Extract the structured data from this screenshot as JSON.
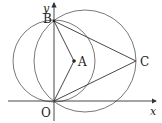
{
  "diagram": {
    "type": "geometry-coordinate-plane",
    "axes": {
      "x_label": "x",
      "y_label": "y"
    },
    "points": {
      "O": {
        "label": "O",
        "x": 54,
        "y": 101
      },
      "B": {
        "label": "B",
        "x": 54,
        "y": 21
      },
      "A": {
        "label": "A",
        "x": 74,
        "y": 61
      },
      "C": {
        "label": "C",
        "x": 136,
        "y": 61
      }
    },
    "circles": [
      {
        "name": "circle-diameter-OB",
        "cx": 54,
        "cy": 61,
        "r": 41
      },
      {
        "name": "circle-through-OBC",
        "cx": 85,
        "cy": 61,
        "r": 51
      }
    ],
    "segments": [
      "BA",
      "AO",
      "BC",
      "OC"
    ],
    "colors": {
      "line": "#333333",
      "circle": "#555555",
      "background": "#ffffff"
    }
  }
}
